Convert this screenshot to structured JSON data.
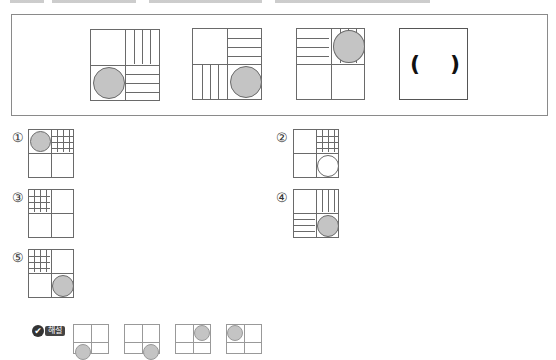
{
  "question": {
    "top_text_cut": "",
    "sequence": [
      {
        "id": "seq-1",
        "tl": "blank",
        "tr": "vlines",
        "bl": "filled-circle",
        "br": "hlines"
      },
      {
        "id": "seq-2",
        "tl": "blank",
        "tr": "hlines",
        "bl": "vlines",
        "br": "filled-circle"
      },
      {
        "id": "seq-3",
        "tl": "hlines",
        "tr": "filled-circle-over-vlines",
        "bl": "blank",
        "br": "blank"
      },
      {
        "id": "seq-4",
        "answer_placeholder_left": "(",
        "answer_placeholder_right": ")"
      }
    ]
  },
  "options": [
    {
      "number": "①",
      "tl": "filled-circle",
      "tr": "grid",
      "bl": "blank",
      "br": "blank"
    },
    {
      "number": "②",
      "tl": "blank",
      "tr": "grid",
      "bl": "blank",
      "br": "empty-circle"
    },
    {
      "number": "③",
      "tl": "grid",
      "tr": "blank",
      "bl": "blank",
      "br": "blank"
    },
    {
      "number": "④",
      "tl": "blank",
      "tr": "vlines",
      "bl": "hlines",
      "br": "filled-circle"
    },
    {
      "number": "⑤",
      "tl": "grid",
      "tr": "blank",
      "bl": "blank",
      "br": "filled-circle"
    }
  ],
  "explanation": {
    "badge_icon": "✔",
    "badge_label": "해설",
    "figures": [
      {
        "circle_cell": "bottom-left"
      },
      {
        "circle_cell": "bottom-right"
      },
      {
        "circle_cell": "top-right"
      },
      {
        "circle_cell": "top-left"
      }
    ]
  }
}
